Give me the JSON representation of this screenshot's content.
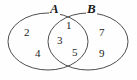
{
  "figure": {
    "type": "venn-diagram",
    "background_color": "#fefefe",
    "stroke_color": "#3a3a3a",
    "text_color": "#1a1a1a"
  },
  "sets": [
    {
      "id": "a",
      "label": "A",
      "label_x": 49,
      "label_y": 2
    },
    {
      "id": "b",
      "label": "B",
      "label_x": 86,
      "label_y": 2
    }
  ],
  "regions": {
    "left_only": {
      "name": "A only",
      "elements": [
        {
          "value": "2",
          "x": 24,
          "y": 27
        },
        {
          "value": "4",
          "x": 35,
          "y": 48
        }
      ]
    },
    "intersection": {
      "name": "A intersect B",
      "elements": [
        {
          "value": "1",
          "x": 66,
          "y": 20
        },
        {
          "value": "3",
          "x": 57,
          "y": 35
        },
        {
          "value": "5",
          "x": 72,
          "y": 47
        }
      ]
    },
    "right_only": {
      "name": "B only",
      "elements": [
        {
          "value": "7",
          "x": 99,
          "y": 27
        },
        {
          "value": "9",
          "x": 99,
          "y": 48
        }
      ]
    }
  }
}
